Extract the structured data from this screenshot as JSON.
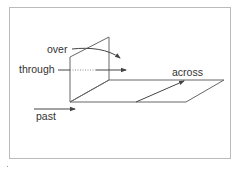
{
  "diagram": {
    "labels": {
      "over": "over",
      "through": "through",
      "across": "across",
      "past": "past"
    },
    "colors": {
      "line": "#555555",
      "frame": "#bbbbbb",
      "text": "#333333",
      "background": "#ffffff"
    }
  }
}
